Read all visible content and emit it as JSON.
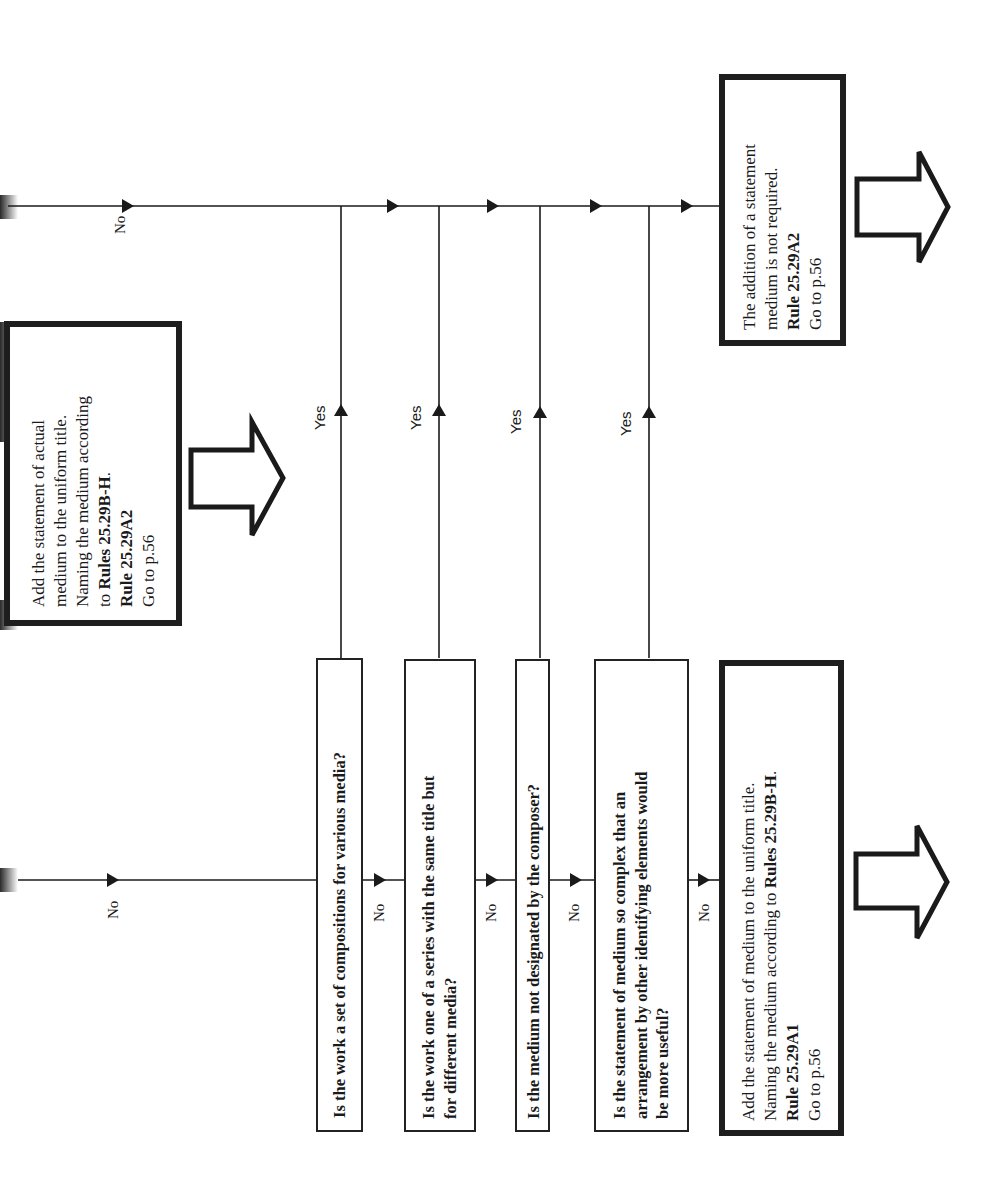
{
  "diagram": {
    "orientation": "rotated-90-ccw",
    "colors": {
      "ink": "#1a1a1a",
      "background": "#ffffff"
    },
    "branch_labels": {
      "no": "No",
      "yes": "Yes"
    },
    "top_outcome": {
      "lines": [
        {
          "text": "Add the statement of actual"
        },
        {
          "text": "medium to the uniform title."
        },
        {
          "text": "Naming the medium according"
        },
        {
          "pre": "to ",
          "bold": "Rules 25.29B-H",
          "post": "."
        },
        {
          "bold": "Rule 25.29A2"
        },
        {
          "text": "Go to p.56"
        }
      ]
    },
    "questions": [
      {
        "lines": [
          "Is the work a set of compositions for various media?"
        ]
      },
      {
        "lines": [
          "Is the work one of a series with the same title but",
          "for different media?"
        ]
      },
      {
        "lines": [
          "Is the medium not designated by the composer?"
        ]
      },
      {
        "lines": [
          "Is the statement of medium so complex that an",
          "arrangement by other identifying elements would",
          "be more useful?"
        ]
      }
    ],
    "outcome_not_required": {
      "lines": [
        {
          "text": "The addition of a statement"
        },
        {
          "text": "medium is not required."
        },
        {
          "bold": "Rule 25.29A2"
        },
        {
          "text": "Go to p.56"
        }
      ]
    },
    "outcome_add_medium": {
      "lines": [
        {
          "text": "Add the statement of medium to the uniform title."
        },
        {
          "pre": "Naming the medium according to ",
          "bold": "Rules 25.29B-H",
          "post": "."
        },
        {
          "bold": "Rule 25.29A1"
        },
        {
          "text": "Go to p.56"
        }
      ]
    },
    "continue_arrows": [
      "next-page-arrow-top",
      "next-page-arrow-left",
      "next-page-arrow-bottom"
    ]
  }
}
